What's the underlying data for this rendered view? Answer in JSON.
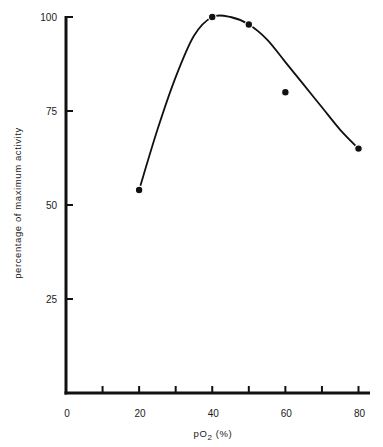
{
  "chart_data": {
    "type": "line",
    "title": "",
    "xlabel": "pO2 (%)",
    "ylabel": "percentage of maximum activity",
    "xlim": [
      0,
      80
    ],
    "ylim": [
      0,
      100
    ],
    "x_ticks": [
      0,
      10,
      20,
      30,
      40,
      50,
      60,
      70,
      80
    ],
    "x_tick_labels": [
      "0",
      "20",
      "40",
      "60",
      "80"
    ],
    "x_tick_label_values": [
      0,
      20,
      40,
      60,
      80
    ],
    "y_ticks": [
      25,
      50,
      75,
      100
    ],
    "y_tick_labels": [
      "25",
      "50",
      "75",
      "100"
    ],
    "grid": false,
    "legend": null,
    "series": [
      {
        "name": "measured activity",
        "style": "markers",
        "x": [
          20,
          40,
          50,
          60,
          80
        ],
        "y": [
          54,
          100,
          98,
          80,
          65
        ]
      },
      {
        "name": "fitted curve",
        "style": "smooth-line",
        "x": [
          20,
          25,
          30,
          35,
          40,
          45,
          50,
          55,
          60,
          65,
          70,
          75,
          80
        ],
        "y": [
          54,
          70,
          84,
          95,
          100,
          100,
          98,
          94,
          88,
          82,
          76,
          70,
          65
        ]
      }
    ]
  },
  "axes": {
    "x_title_main": "pO",
    "x_title_sub": "2",
    "x_title_unit": " (%)",
    "y_title": "percentage of maximum activity"
  }
}
